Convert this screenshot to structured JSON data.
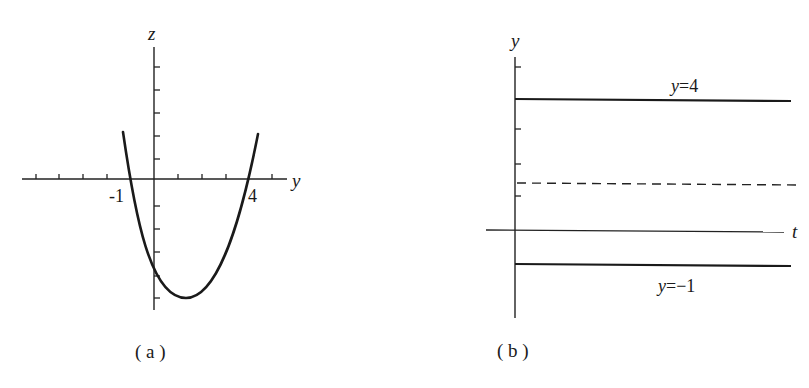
{
  "panel_a": {
    "caption": "( a )",
    "horizontal_axis_label": "y",
    "vertical_axis_label": "z",
    "root_labels": [
      "-1",
      "4"
    ],
    "curve": "parabola z opening upward, crossing y-axis at -1 and 4"
  },
  "panel_b": {
    "caption": "( b )",
    "horizontal_axis_label": "t",
    "vertical_axis_label": "y",
    "lines": [
      {
        "label": "y=4",
        "style": "solid"
      },
      {
        "label": "",
        "style": "dashed"
      },
      {
        "label": "y=−1",
        "style": "solid"
      }
    ]
  },
  "colors": {
    "ink": "#1a1a1a",
    "background": "#ffffff"
  }
}
